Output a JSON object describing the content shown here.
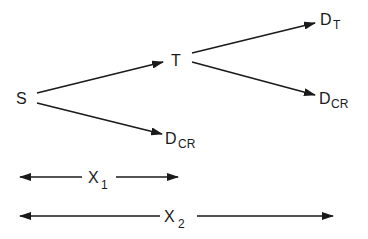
{
  "diagram": {
    "type": "branching-flow",
    "colors": {
      "ink": "#1a1a1a",
      "background": "#ffffff"
    },
    "nodes": {
      "S": {
        "main": "S",
        "sub": ""
      },
      "T": {
        "main": "T",
        "sub": ""
      },
      "DT": {
        "main": "D",
        "sub": "T"
      },
      "DCR_upper": {
        "main": "D",
        "sub": "CR"
      },
      "DCR_lower": {
        "main": "D",
        "sub": "CR"
      }
    },
    "edges": [
      {
        "from": "S",
        "to": "T"
      },
      {
        "from": "S",
        "to": "DCR_lower"
      },
      {
        "from": "T",
        "to": "DT"
      },
      {
        "from": "T",
        "to": "DCR_upper"
      }
    ],
    "dimensions": {
      "x1": {
        "main": "X",
        "sub": "1"
      },
      "x2": {
        "main": "X",
        "sub": "2"
      }
    }
  }
}
